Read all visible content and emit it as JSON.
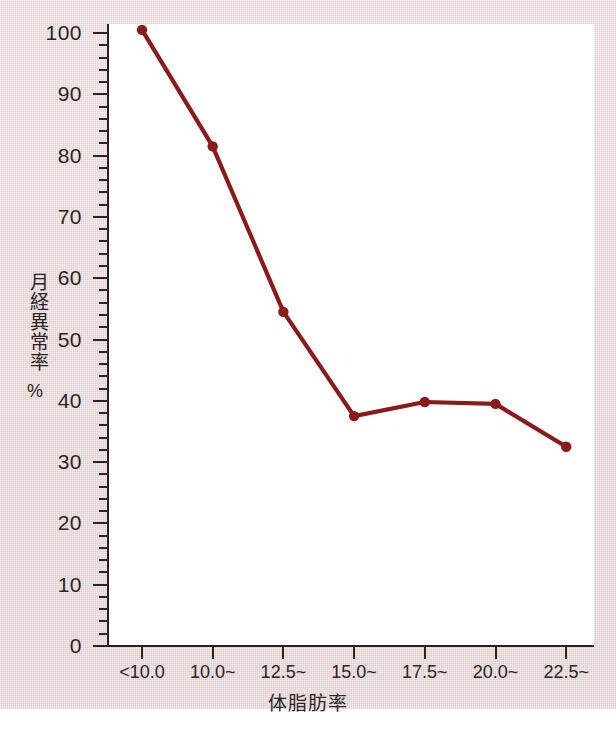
{
  "figure": {
    "colors": {
      "paper_background": "#e8d5d6",
      "plot_background": "#ffffff",
      "axis": "#2a2323",
      "series_line": "#8b1a1a",
      "series_marker": "#8b1a1a",
      "tick_text": "#2b2424"
    }
  },
  "chart_data": {
    "type": "line",
    "title": "",
    "subtitle": "",
    "xlabel": "体脂肪率",
    "ylabel": "月経異常率",
    "yunit": "%",
    "categories": [
      "<10.0",
      "10.0~",
      "12.5~",
      "15.0~",
      "17.5~",
      "20.0~",
      "22.5~"
    ],
    "values": [
      100.5,
      81.5,
      54.5,
      37.5,
      39.8,
      39.5,
      32.5
    ],
    "series": [
      {
        "name": "月経異常率",
        "values": [
          100.5,
          81.5,
          54.5,
          37.5,
          39.8,
          39.5,
          32.5
        ]
      }
    ],
    "ylim": [
      0,
      100
    ],
    "y_major_ticks": [
      0,
      10,
      20,
      30,
      40,
      50,
      60,
      70,
      80,
      90,
      100
    ],
    "y_major_tick_labels": [
      "0",
      "10",
      "20",
      "30",
      "40",
      "50",
      "60",
      "70",
      "80",
      "90",
      "100"
    ],
    "y_minor_tick_step": 2,
    "grid": false,
    "legend": "none",
    "marker": "circle",
    "annotations": []
  }
}
